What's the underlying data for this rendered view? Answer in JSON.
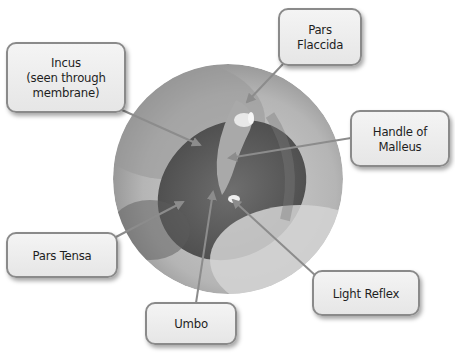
{
  "diagram": {
    "image": {
      "shape": "circle",
      "center": [
        228,
        179
      ],
      "radius": 115,
      "description": "grayscale otoscope photo of eardrum"
    },
    "labels": [
      {
        "id": "incus",
        "text": "Incus\n(seen through\nmembrane)",
        "box": [
          6,
          42,
          120,
          71
        ],
        "line_from": [
          122,
          110
        ],
        "arrow_to": [
          200,
          145
        ]
      },
      {
        "id": "pars-flaccida",
        "text": "Pars\nFlaccida",
        "box": [
          278,
          8,
          84,
          58
        ],
        "line_from": [
          283,
          64
        ],
        "arrow_to": [
          247,
          102
        ]
      },
      {
        "id": "handle-of-malleus",
        "text": "Handle of\nMalleus",
        "box": [
          350,
          110,
          100,
          57
        ],
        "line_from": [
          351,
          138
        ],
        "arrow_to": [
          229,
          158
        ]
      },
      {
        "id": "pars-tensa",
        "text": "Pars Tensa",
        "box": [
          6,
          232,
          112,
          46
        ],
        "line_from": [
          114,
          238
        ],
        "arrow_to": [
          183,
          202
        ]
      },
      {
        "id": "light-reflex",
        "text": "Light Reflex",
        "box": [
          312,
          270,
          108,
          46
        ],
        "line_from": [
          316,
          276
        ],
        "arrow_to": [
          233,
          200
        ]
      },
      {
        "id": "umbo",
        "text": "Umbo",
        "box": [
          145,
          302,
          92,
          43
        ],
        "line_from": [
          196,
          303
        ],
        "arrow_to": [
          213,
          192
        ]
      }
    ],
    "colors": {
      "box_fill": "#ececec",
      "box_border": "#8a8a8a",
      "text": "#1e1e1e",
      "arrow": "#8c8c8c"
    }
  }
}
